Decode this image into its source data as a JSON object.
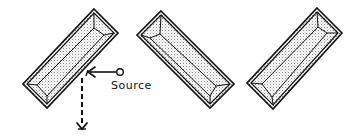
{
  "figure": {
    "colors": {
      "stroke": "#111111",
      "fill_dots": "#9a9a9a",
      "background": "#ffffff"
    },
    "shapes": [
      {
        "id": "frame-1",
        "orientation": "rotated-left",
        "corners": {
          "top": [
            94,
            9
          ],
          "right": [
            118,
            33
          ],
          "bottom": [
            47,
            108
          ],
          "left": [
            23,
            84
          ]
        }
      },
      {
        "id": "frame-2",
        "orientation": "rotated-right",
        "corners": {
          "top": [
            161,
            11
          ],
          "right": [
            234,
            84
          ],
          "bottom": [
            210,
            108
          ],
          "left": [
            137,
            35
          ]
        }
      },
      {
        "id": "frame-3",
        "orientation": "rotated-left",
        "corners": {
          "top": [
            317,
            8
          ],
          "right": [
            342,
            33
          ],
          "bottom": [
            273,
            109
          ],
          "left": [
            247,
            83
          ]
        }
      }
    ],
    "source": {
      "label": "Source",
      "marker": "open-circle",
      "arrow": "solid-arrow-to-frame-1",
      "output_arrow": "dashed-downward-arrow"
    }
  }
}
